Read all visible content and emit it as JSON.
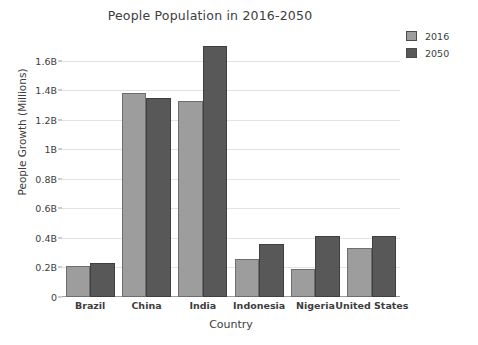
{
  "chart_data": {
    "type": "bar",
    "title": "People Population in 2016-2050",
    "xlabel": "Country",
    "ylabel": "People Growth (Millions)",
    "categories": [
      "Brazil",
      "China",
      "India",
      "Indonesia",
      "Nigeria",
      "United States"
    ],
    "series": [
      {
        "name": "2016",
        "color": "#9d9d9d",
        "values": [
          0.21,
          1.38,
          1.33,
          0.26,
          0.19,
          0.33
        ]
      },
      {
        "name": "2050",
        "color": "#585858",
        "values": [
          0.23,
          1.35,
          1.7,
          0.36,
          0.41,
          0.41
        ]
      }
    ],
    "ylim": [
      0,
      1.72
    ],
    "yticks": [
      0,
      0.2,
      0.4,
      0.6,
      0.8,
      1.0,
      1.2,
      1.4,
      1.6
    ],
    "ytick_labels": [
      "0",
      "0.2B",
      "0.4B",
      "0.6B",
      "0.8B",
      "1B",
      "1.2B",
      "1.4B",
      "1.6B"
    ],
    "grid": true,
    "legend_position": "upper right",
    "units": "Billions"
  }
}
